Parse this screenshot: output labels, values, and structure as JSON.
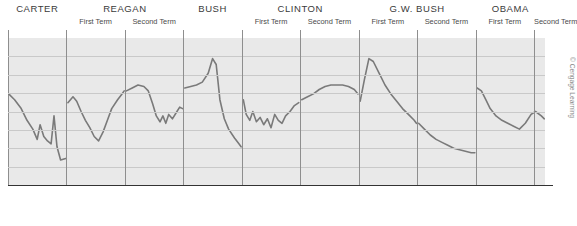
{
  "header": {
    "presidents": [
      {
        "name": "CARTER",
        "terms": [
          "",
          ""
        ],
        "single_term_label": null
      },
      {
        "name": "REAGAN",
        "terms": [
          "First Term",
          "Second Term"
        ]
      },
      {
        "name": "BUSH",
        "terms": [
          "",
          ""
        ]
      },
      {
        "name": "CLINTON",
        "terms": [
          "First Term",
          "Second Term"
        ]
      },
      {
        "name": "G.W. BUSH",
        "terms": [
          "First Term",
          "Second Term"
        ]
      },
      {
        "name": "OBAMA",
        "terms": [
          "First Term",
          "Second Term"
        ]
      }
    ],
    "names": [
      "CARTER",
      "REAGAN",
      "BUSH",
      "CLINTON",
      "G.W. BUSH",
      "OBAMA"
    ],
    "term_labels": [
      "First Term",
      "Second Term",
      "First Term",
      "Second Term",
      "First Term",
      "Second Term",
      "First Term",
      "Second Term",
      "First Term",
      "Second Term"
    ]
  },
  "axis": {
    "labels": [
      "1977",
      "1979",
      "1981",
      "1983",
      "1985",
      "1987",
      "1989",
      "1991",
      "1993",
      "1995",
      "1997",
      "1999",
      "2001",
      "2003",
      "2005",
      "2007",
      "2009",
      "2011",
      "2013"
    ]
  },
  "credit": {
    "text": "© Cengage Learning"
  },
  "footnote": {
    "text": ""
  },
  "colors": {
    "plot_background": "#e9e9e9",
    "gridline": "#c9c9c9",
    "term_separator": "#8e8e8e",
    "series_line": "#7a7a7a",
    "axis": "#333333"
  },
  "chart_data": {
    "type": "line",
    "title": "",
    "subtitle": "",
    "xlabel": "",
    "ylabel": "",
    "xlim": [
      1977,
      2013.75
    ],
    "ylim": [
      0,
      100
    ],
    "grid": true,
    "legend": null,
    "axis_tick_labels": [
      "1977",
      "1979",
      "1981",
      "1983",
      "1985",
      "1987",
      "1989",
      "1991",
      "1993",
      "1995",
      "1997",
      "1999",
      "2001",
      "2003",
      "2005",
      "2007",
      "2009",
      "2011",
      "2013"
    ],
    "tick_years_all": [
      1977,
      1978,
      1979,
      1980,
      1981,
      1982,
      1983,
      1984,
      1985,
      1986,
      1987,
      1988,
      1989,
      1990,
      1991,
      1992,
      1993,
      1994,
      1995,
      1996,
      1997,
      1998,
      1999,
      2000,
      2001,
      2002,
      2003,
      2004,
      2005,
      2006,
      2007,
      2008,
      2009,
      2010,
      2011,
      2012,
      2013
    ],
    "term_boundaries": [
      1981,
      1985,
      1989,
      1993,
      1997,
      2001,
      2005,
      2009,
      2013
    ],
    "president_bands": [
      {
        "name": "CARTER",
        "start": 1977,
        "end": 1981,
        "terms": [
          {
            "label": "",
            "start": 1977,
            "end": 1981
          }
        ]
      },
      {
        "name": "REAGAN",
        "start": 1981,
        "end": 1989,
        "terms": [
          {
            "label": "First Term",
            "start": 1981,
            "end": 1985
          },
          {
            "label": "Second Term",
            "start": 1985,
            "end": 1989
          }
        ]
      },
      {
        "name": "BUSH",
        "start": 1989,
        "end": 1993,
        "terms": [
          {
            "label": "",
            "start": 1989,
            "end": 1993
          }
        ]
      },
      {
        "name": "CLINTON",
        "start": 1993,
        "end": 2001,
        "terms": [
          {
            "label": "First Term",
            "start": 1993,
            "end": 1997
          },
          {
            "label": "Second Term",
            "start": 1997,
            "end": 2001
          }
        ]
      },
      {
        "name": "G.W. BUSH",
        "start": 2001,
        "end": 2009,
        "terms": [
          {
            "label": "First Term",
            "start": 2001,
            "end": 2005
          },
          {
            "label": "Second Term",
            "start": 2005,
            "end": 2009
          }
        ]
      },
      {
        "name": "OBAMA",
        "start": 2009,
        "end": 2013.75,
        "terms": [
          {
            "label": "First Term",
            "start": 2009,
            "end": 2013
          },
          {
            "label": "Second Term",
            "start": 2013,
            "end": 2013.75
          }
        ]
      }
    ],
    "note": "Series is drawn as separate segments, one per presidential administration; gaps occur at term transitions.",
    "series": [
      {
        "name": "Carter",
        "points": [
          [
            1977.05,
            62
          ],
          [
            1977.45,
            58
          ],
          [
            1977.9,
            52
          ],
          [
            1978.3,
            44
          ],
          [
            1978.7,
            38
          ],
          [
            1979.0,
            31
          ],
          [
            1979.2,
            41
          ],
          [
            1979.45,
            33
          ],
          [
            1979.7,
            30
          ],
          [
            1979.95,
            28
          ],
          [
            1980.15,
            47
          ],
          [
            1980.35,
            26
          ],
          [
            1980.6,
            17
          ],
          [
            1980.95,
            18
          ]
        ]
      },
      {
        "name": "Reagan first term",
        "points": [
          [
            1981.1,
            56
          ],
          [
            1981.45,
            60
          ],
          [
            1981.7,
            57
          ],
          [
            1982.0,
            50
          ],
          [
            1982.3,
            44
          ],
          [
            1982.6,
            39
          ],
          [
            1982.9,
            33
          ],
          [
            1983.2,
            30
          ],
          [
            1983.5,
            36
          ],
          [
            1983.8,
            44
          ],
          [
            1984.1,
            52
          ],
          [
            1984.5,
            58
          ],
          [
            1984.8,
            62
          ],
          [
            1984.95,
            64
          ]
        ]
      },
      {
        "name": "Reagan second term",
        "points": [
          [
            1985.1,
            64
          ],
          [
            1985.5,
            66
          ],
          [
            1985.9,
            68
          ],
          [
            1986.3,
            67
          ],
          [
            1986.6,
            64
          ],
          [
            1986.9,
            55
          ],
          [
            1987.15,
            47
          ],
          [
            1987.4,
            43
          ],
          [
            1987.6,
            47
          ],
          [
            1987.8,
            42
          ],
          [
            1988.0,
            48
          ],
          [
            1988.25,
            45
          ],
          [
            1988.5,
            49
          ],
          [
            1988.75,
            53
          ],
          [
            1988.95,
            52
          ]
        ]
      },
      {
        "name": "Bush",
        "points": [
          [
            1989.1,
            66
          ],
          [
            1989.5,
            67
          ],
          [
            1989.9,
            68
          ],
          [
            1990.3,
            70
          ],
          [
            1990.7,
            76
          ],
          [
            1991.0,
            86
          ],
          [
            1991.25,
            82
          ],
          [
            1991.5,
            58
          ],
          [
            1991.8,
            45
          ],
          [
            1992.1,
            38
          ],
          [
            1992.5,
            32
          ],
          [
            1992.8,
            28
          ],
          [
            1992.95,
            26
          ]
        ]
      },
      {
        "name": "Clinton first term",
        "points": [
          [
            1993.1,
            58
          ],
          [
            1993.3,
            48
          ],
          [
            1993.55,
            44
          ],
          [
            1993.75,
            50
          ],
          [
            1994.0,
            43
          ],
          [
            1994.25,
            46
          ],
          [
            1994.5,
            41
          ],
          [
            1994.75,
            45
          ],
          [
            1995.0,
            39
          ],
          [
            1995.25,
            48
          ],
          [
            1995.5,
            44
          ],
          [
            1995.75,
            42
          ],
          [
            1996.0,
            47
          ],
          [
            1996.3,
            50
          ],
          [
            1996.6,
            54
          ],
          [
            1996.9,
            56
          ]
        ]
      },
      {
        "name": "Clinton second term",
        "points": [
          [
            1997.1,
            58
          ],
          [
            1997.5,
            60
          ],
          [
            1997.9,
            62
          ],
          [
            1998.3,
            65
          ],
          [
            1998.7,
            67
          ],
          [
            1999.1,
            68
          ],
          [
            1999.5,
            68
          ],
          [
            1999.9,
            68
          ],
          [
            2000.3,
            67
          ],
          [
            2000.7,
            65
          ],
          [
            2000.95,
            62
          ]
        ]
      },
      {
        "name": "G.W. Bush first term",
        "points": [
          [
            2001.1,
            57
          ],
          [
            2001.4,
            72
          ],
          [
            2001.7,
            86
          ],
          [
            2002.0,
            84
          ],
          [
            2002.4,
            76
          ],
          [
            2002.8,
            68
          ],
          [
            2003.2,
            62
          ],
          [
            2003.6,
            57
          ],
          [
            2004.0,
            52
          ],
          [
            2004.4,
            48
          ],
          [
            2004.8,
            44
          ],
          [
            2004.95,
            42
          ]
        ]
      },
      {
        "name": "G.W. Bush second term",
        "points": [
          [
            2005.1,
            42
          ],
          [
            2005.5,
            38
          ],
          [
            2005.9,
            34
          ],
          [
            2006.3,
            31
          ],
          [
            2006.7,
            29
          ],
          [
            2007.1,
            27
          ],
          [
            2007.5,
            25
          ],
          [
            2007.9,
            24
          ],
          [
            2008.3,
            23
          ],
          [
            2008.7,
            22
          ],
          [
            2008.95,
            22
          ]
        ]
      },
      {
        "name": "Obama",
        "points": [
          [
            2009.1,
            66
          ],
          [
            2009.4,
            64
          ],
          [
            2009.7,
            58
          ],
          [
            2010.0,
            52
          ],
          [
            2010.4,
            47
          ],
          [
            2010.8,
            44
          ],
          [
            2011.2,
            42
          ],
          [
            2011.6,
            40
          ],
          [
            2012.0,
            38
          ],
          [
            2012.4,
            42
          ],
          [
            2012.8,
            48
          ],
          [
            2013.1,
            50
          ],
          [
            2013.5,
            47
          ],
          [
            2013.7,
            45
          ]
        ]
      }
    ]
  }
}
